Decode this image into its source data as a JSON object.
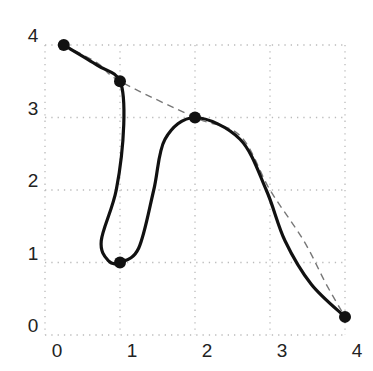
{
  "chart_data": {
    "type": "line",
    "title": "",
    "xlabel": "",
    "ylabel": "",
    "xlim": [
      0,
      4
    ],
    "ylim": [
      0,
      4
    ],
    "grid": true,
    "grid_style": "dotted",
    "x_ticks": [
      "0",
      "1",
      "2",
      "3",
      "4"
    ],
    "y_ticks": [
      "0",
      "1",
      "2",
      "3",
      "4"
    ],
    "control_points": [
      {
        "x": 0.25,
        "y": 4.0
      },
      {
        "x": 1.0,
        "y": 3.5
      },
      {
        "x": 1.0,
        "y": 1.0
      },
      {
        "x": 2.0,
        "y": 3.0
      },
      {
        "x": 4.0,
        "y": 0.25
      }
    ],
    "series": [
      {
        "name": "smooth spline (solid)",
        "style": "solid",
        "color": "#111111",
        "points": [
          [
            0.25,
            4.0
          ],
          [
            0.7,
            3.72
          ],
          [
            1.0,
            3.5
          ],
          [
            1.05,
            2.9
          ],
          [
            0.95,
            2.0
          ],
          [
            0.75,
            1.3
          ],
          [
            0.85,
            1.02
          ],
          [
            1.0,
            1.0
          ],
          [
            1.25,
            1.2
          ],
          [
            1.45,
            2.0
          ],
          [
            1.6,
            2.7
          ],
          [
            2.0,
            3.0
          ],
          [
            2.6,
            2.7
          ],
          [
            2.95,
            2.0
          ],
          [
            3.2,
            1.3
          ],
          [
            3.55,
            0.7
          ],
          [
            4.0,
            0.25
          ]
        ]
      },
      {
        "name": "reference curve (dashed)",
        "style": "dashed",
        "color": "#777777",
        "points": [
          [
            0.25,
            4.0
          ],
          [
            0.7,
            3.75
          ],
          [
            1.0,
            3.5
          ],
          [
            2.0,
            3.0
          ],
          [
            2.6,
            2.75
          ],
          [
            3.0,
            2.0
          ],
          [
            3.45,
            1.3
          ],
          [
            3.75,
            0.7
          ],
          [
            4.0,
            0.25
          ]
        ]
      }
    ]
  }
}
